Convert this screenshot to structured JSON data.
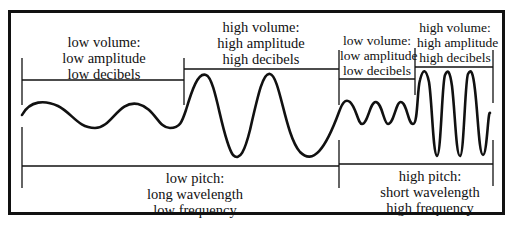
{
  "diagram": {
    "colors": {
      "line": "#111111",
      "background": "#ffffff"
    },
    "top_labels": [
      {
        "id": "low-volume-left",
        "lines": [
          "low volume:",
          "low amplitude",
          "low decibels"
        ]
      },
      {
        "id": "high-volume-left",
        "lines": [
          "high volume:",
          "high amplitude",
          "high decibels"
        ]
      },
      {
        "id": "low-volume-right",
        "lines": [
          "low volume:",
          "low amplitude",
          "low decibels"
        ]
      },
      {
        "id": "high-volume-right",
        "lines": [
          "high volume:",
          "high amplitude",
          "high decibels"
        ]
      }
    ],
    "bottom_labels": [
      {
        "id": "low-pitch",
        "lines": [
          "low pitch:",
          "long wavelength",
          "low frequency"
        ]
      },
      {
        "id": "high-pitch",
        "lines": [
          "high pitch:",
          "short wavelength",
          "high frequency"
        ]
      }
    ],
    "wave_segments": [
      {
        "name": "low-volume-low-pitch",
        "amplitude": "low",
        "wavelength": "long"
      },
      {
        "name": "high-volume-low-pitch",
        "amplitude": "high",
        "wavelength": "long"
      },
      {
        "name": "low-volume-high-pitch",
        "amplitude": "low",
        "wavelength": "short"
      },
      {
        "name": "high-volume-high-pitch",
        "amplitude": "high",
        "wavelength": "short"
      }
    ]
  }
}
